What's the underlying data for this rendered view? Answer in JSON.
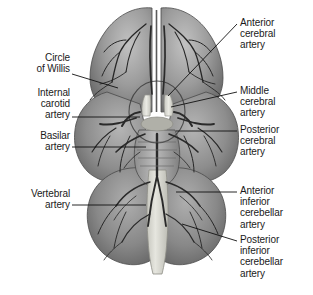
{
  "figure": {
    "view": "inferior surface of the cerebrum, cerebellum and brainstem",
    "background_color": "#ffffff",
    "line_color": "#111111",
    "tissue_colors": {
      "cortex_light": "#b9b9b9",
      "cortex_mid": "#8f8f8f",
      "cortex_dark": "#6e6e6e",
      "cerebellum": "#8a8a8a",
      "brainstem": "#a8a8a8",
      "medulla_light": "#dcdcd6",
      "vessel": "#2a2a2a"
    }
  },
  "labels": {
    "left": [
      {
        "id": "circle-of-willis",
        "text": "Circle\nof Willis",
        "x": 12,
        "y": 52,
        "width": 58,
        "leader": {
          "x1": 72,
          "y1": 74,
          "x2": 118,
          "y2": 88
        }
      },
      {
        "id": "internal-carotid",
        "text": "Internal\ncarotid\nartery",
        "x": 6,
        "y": 87,
        "width": 64,
        "leader": {
          "x1": 72,
          "y1": 117,
          "x2": 140,
          "y2": 117
        }
      },
      {
        "id": "basilar-artery",
        "text": "Basilar\nartery",
        "x": 10,
        "y": 130,
        "width": 60,
        "leader": {
          "x1": 72,
          "y1": 147,
          "x2": 146,
          "y2": 147
        }
      },
      {
        "id": "vertebral-artery",
        "text": "Vertebral\nartery",
        "x": 6,
        "y": 188,
        "width": 64,
        "leader": {
          "x1": 72,
          "y1": 205,
          "x2": 146,
          "y2": 205
        }
      }
    ],
    "right": [
      {
        "id": "anterior-cerebral",
        "text": "Anterior\ncerebral\nartery",
        "x": 240,
        "y": 17,
        "width": 70,
        "leader": {
          "x1": 237,
          "y1": 24,
          "x2": 168,
          "y2": 96
        }
      },
      {
        "id": "middle-cerebral",
        "text": "Middle\ncerebral\nartery",
        "x": 240,
        "y": 85,
        "width": 70,
        "leader": {
          "x1": 237,
          "y1": 92,
          "x2": 171,
          "y2": 107
        }
      },
      {
        "id": "posterior-cerebral",
        "text": "Posterior\ncerebral\nartery",
        "x": 240,
        "y": 124,
        "width": 70,
        "leader": {
          "x1": 237,
          "y1": 131,
          "x2": 176,
          "y2": 131
        }
      },
      {
        "id": "anterior-inferior-cerebellar",
        "text": "Anterior\ninferior\ncerebellar\nartery",
        "x": 240,
        "y": 185,
        "width": 70,
        "leader": {
          "x1": 237,
          "y1": 192,
          "x2": 176,
          "y2": 192
        }
      },
      {
        "id": "posterior-inferior-cerebellar",
        "text": "Posterior\ninferior\ncerebellar\nartery",
        "x": 240,
        "y": 234,
        "width": 70,
        "leader": {
          "x1": 237,
          "y1": 241,
          "x2": 182,
          "y2": 224
        }
      }
    ]
  }
}
